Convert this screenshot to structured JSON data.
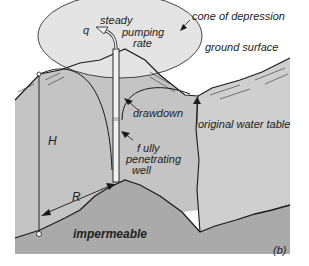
{
  "diagram": {
    "panel_label": "(b)",
    "colors": {
      "ground_fill": "#bdbdbd",
      "aquifer_fill": "#c9c9c9",
      "impermeable_fill": "#a9a9a9",
      "cone_fill": "#e6e6e6",
      "line": "#1a1a1a",
      "background": "#ffffff"
    },
    "labels": {
      "q": "q",
      "steady": "steady",
      "pumping": "pumping",
      "rate": "rate",
      "cone_of_depression": "cone of depression",
      "ground_surface": "ground surface",
      "drawdown": "drawdown",
      "original_water_table": "original water table",
      "H": "H",
      "R": "R",
      "fully": "f ully",
      "penetrating": "penetrating",
      "well": "well",
      "impermeable": "impermeable"
    }
  }
}
